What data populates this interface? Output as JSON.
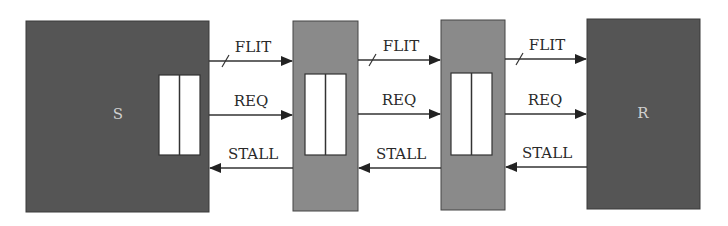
{
  "diagram": {
    "type": "pipeline-flow-control",
    "colors": {
      "endpoint_fill": "#555555",
      "relay_fill": "#8a8a8a",
      "buffer_fill": "#ffffff",
      "stroke": "#333333",
      "wire": "#333333"
    },
    "nodes": [
      {
        "id": "sender",
        "label": "S",
        "kind": "endpoint",
        "has_buffer": true
      },
      {
        "id": "relay1",
        "label": "",
        "kind": "relay-station",
        "has_buffer": true
      },
      {
        "id": "relay2",
        "label": "",
        "kind": "relay-station",
        "has_buffer": true
      },
      {
        "id": "receiver",
        "label": "R",
        "kind": "endpoint",
        "has_buffer": false
      }
    ],
    "links": [
      {
        "from": "sender",
        "to": "relay1",
        "signals": [
          {
            "name": "FLIT",
            "direction": "forward",
            "bus": true
          },
          {
            "name": "REQ",
            "direction": "forward",
            "bus": false
          },
          {
            "name": "STALL",
            "direction": "backward",
            "bus": false
          }
        ]
      },
      {
        "from": "relay1",
        "to": "relay2",
        "signals": [
          {
            "name": "FLIT",
            "direction": "forward",
            "bus": true
          },
          {
            "name": "REQ",
            "direction": "forward",
            "bus": false
          },
          {
            "name": "STALL",
            "direction": "backward",
            "bus": false
          }
        ]
      },
      {
        "from": "relay2",
        "to": "receiver",
        "signals": [
          {
            "name": "FLIT",
            "direction": "forward",
            "bus": true
          },
          {
            "name": "REQ",
            "direction": "forward",
            "bus": false
          },
          {
            "name": "STALL",
            "direction": "backward",
            "bus": false
          }
        ]
      }
    ]
  }
}
